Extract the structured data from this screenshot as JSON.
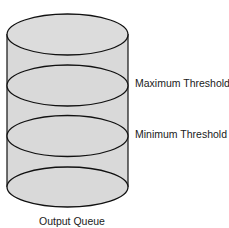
{
  "diagram": {
    "title": "Output Queue",
    "shape": "cylinder",
    "fill_color": "#d9d9d9",
    "stroke_color": "#111111",
    "levels": [
      {
        "name": "top",
        "label": ""
      },
      {
        "name": "maximum-threshold",
        "label": "Maximum Threshold"
      },
      {
        "name": "minimum-threshold",
        "label": "Minimum Threshold"
      },
      {
        "name": "bottom",
        "label": ""
      }
    ]
  }
}
